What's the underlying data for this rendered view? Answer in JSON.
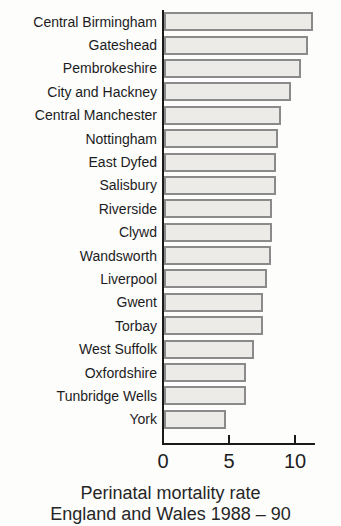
{
  "chart_data": {
    "type": "bar",
    "orientation": "horizontal",
    "title": "Perinatal mortality rate",
    "subtitle": "England and Wales 1988 – 90",
    "xlabel": "",
    "ylabel": "",
    "xticks": [
      0,
      5,
      10
    ],
    "xlim": [
      0,
      11.5
    ],
    "grid": false,
    "legend": "none",
    "bar_fill_color": "#edebe8",
    "bar_border_color": "#8a8a8a",
    "axis_color": "#1a1a1a",
    "categories": [
      "Central Birmingham",
      "Gateshead",
      "Pembrokeshire",
      "City and Hackney",
      "Central Manchester",
      "Nottingham",
      "East Dyfed",
      "Salisbury",
      "Riverside",
      "Clywd",
      "Wandsworth",
      "Liverpool",
      "Gwent",
      "Torbay",
      "West Suffolk",
      "Oxfordshire",
      "Tunbridge Wells",
      "York"
    ],
    "values": [
      11.3,
      10.9,
      10.4,
      9.6,
      8.9,
      8.6,
      8.5,
      8.5,
      8.2,
      8.2,
      8.1,
      7.8,
      7.5,
      7.5,
      6.8,
      6.2,
      6.2,
      4.7
    ]
  }
}
